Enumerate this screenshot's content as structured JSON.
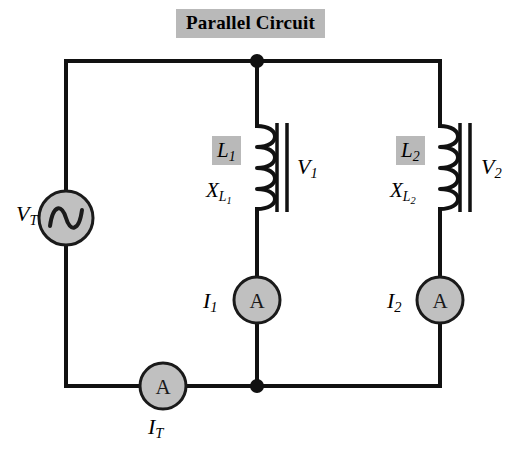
{
  "title": {
    "text": "Parallel Circuit",
    "highlight_color": "#b9b9b9"
  },
  "colors": {
    "wire": "#111111",
    "component_fill": "#c0c0c0",
    "component_stroke": "#1a1a1a",
    "highlight": "#b9b9b9",
    "background": "#ffffff"
  },
  "source": {
    "name": "ac-voltage-source",
    "label": "V",
    "label_sub": "T",
    "symbol": "sine-wave"
  },
  "branches": [
    {
      "inductor_label": "L",
      "inductor_sub": "1",
      "reactance_label": "X",
      "reactance_sub": "L",
      "reactance_sub_sub": "1",
      "voltage_label": "V",
      "voltage_sub": "1",
      "current_label": "I",
      "current_sub": "1",
      "meter_symbol": "A"
    },
    {
      "inductor_label": "L",
      "inductor_sub": "2",
      "reactance_label": "X",
      "reactance_sub": "L",
      "reactance_sub_sub": "2",
      "voltage_label": "V",
      "voltage_sub": "2",
      "current_label": "I",
      "current_sub": "2",
      "meter_symbol": "A"
    }
  ],
  "total_meter": {
    "name": "total-current-ammeter",
    "meter_symbol": "A",
    "label": "I",
    "label_sub": "T"
  }
}
